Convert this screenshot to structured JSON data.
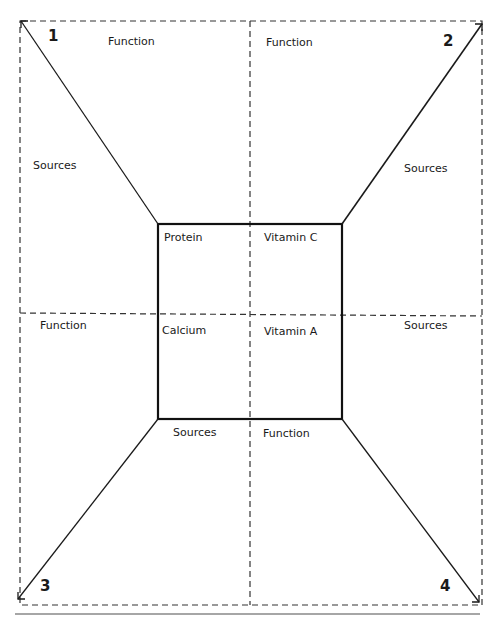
{
  "diagram": {
    "type": "four-door-foldable-graphic-organizer",
    "corners": {
      "1": "1",
      "2": "2",
      "3": "3",
      "4": "4"
    },
    "center_cells": {
      "top_left": "Protein",
      "top_right": "Vitamin C",
      "bottom_left": "Calcium",
      "bottom_right": "Vitamin A"
    },
    "flaps": {
      "top_left_top": "Function",
      "top_left_side": "Sources",
      "top_right_top": "Function",
      "top_right_side": "Sources",
      "bottom_left_side": "Function",
      "bottom_left_bottom": "Sources",
      "bottom_right_side": "Sources",
      "bottom_right_bottom": "Function"
    },
    "colors": {
      "line": "#1a1a1a",
      "dashed": "#333333",
      "rule": "#888888",
      "background": "#ffffff"
    }
  }
}
